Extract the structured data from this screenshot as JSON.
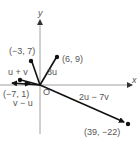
{
  "diagram": {
    "axes": {
      "x_label": "x",
      "y_label": "y",
      "origin_label": "O"
    },
    "points": [
      {
        "id": "neg3_7",
        "label": "(−3, 7)"
      },
      {
        "id": "6_9",
        "label": "(6, 9)"
      },
      {
        "id": "neg7_1",
        "label": "(−7, 1)"
      },
      {
        "id": "39_neg22",
        "label": "(39, −22)"
      }
    ],
    "vectors": [
      {
        "id": "u_plus_v",
        "label": "u + v"
      },
      {
        "id": "three_u",
        "label": "3u"
      },
      {
        "id": "v_minus_u",
        "label": "v − u"
      },
      {
        "id": "two_u_minus_seven_v",
        "label": "2u − 7v"
      }
    ],
    "colors": {
      "axis": "#888888",
      "vector": "#111111",
      "label": "#555555"
    }
  }
}
